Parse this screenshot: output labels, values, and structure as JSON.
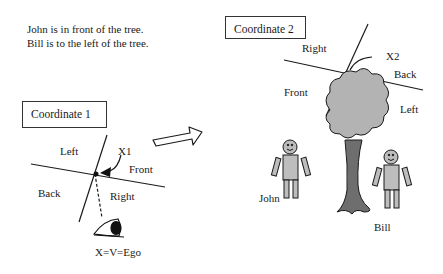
{
  "statements": [
    "John is in front of the tree.",
    "Bill is to the left of the tree."
  ],
  "coordinate1": {
    "title": "Coordinate 1",
    "labels": {
      "left": "Left",
      "front": "Front",
      "back": "Back",
      "right": "Right",
      "origin": "X1"
    },
    "viewer_label": "X=V=Ego"
  },
  "coordinate2": {
    "title": "Coordinate 2",
    "labels": {
      "right": "Right",
      "back": "Back",
      "front": "Front",
      "left": "Left",
      "origin": "X2"
    }
  },
  "people": {
    "john": "John",
    "bill": "Bill"
  },
  "colors": {
    "line": "#1a1a1a",
    "tree_crown": "#b3b3b3",
    "tree_trunk": "#6e6e6e",
    "person_fill": "#bdbdbd"
  }
}
